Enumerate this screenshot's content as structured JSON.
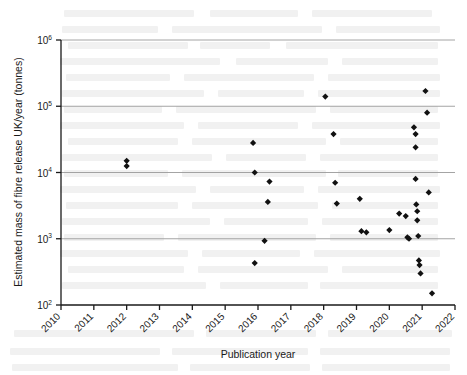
{
  "chart_data": {
    "type": "scatter",
    "title": "",
    "xlabel": "Publication year",
    "ylabel": "Estimated mass of fibre release UK/year (tonnes)",
    "xlim": [
      2010,
      2022
    ],
    "ylim": [
      100,
      1000000
    ],
    "yscale": "log",
    "xscale": "linear",
    "grid": "horizontal-major",
    "legend": "none",
    "marker": "filled-diamond",
    "marker_color": "#111111",
    "xticks": [
      "2010",
      "2011",
      "2012",
      "2013",
      "2014",
      "2015",
      "2016",
      "2017",
      "2018",
      "2019",
      "2020",
      "2021",
      "2022"
    ],
    "xtick_values": [
      2010,
      2011,
      2012,
      2013,
      2014,
      2015,
      2016,
      2017,
      2018,
      2019,
      2020,
      2021,
      2022
    ],
    "xtick_rotation": -45,
    "yticks": [
      "10^2",
      "10^3",
      "10^4",
      "10^5",
      "10^6"
    ],
    "ytick_values": [
      100,
      1000,
      10000,
      100000,
      1000000
    ],
    "ytick_mantissa": "10",
    "ytick_exponents": [
      "2",
      "3",
      "4",
      "5",
      "6"
    ],
    "points": [
      {
        "x": 2012.0,
        "y": 15000
      },
      {
        "x": 2012.0,
        "y": 12500
      },
      {
        "x": 2015.85,
        "y": 28000
      },
      {
        "x": 2015.9,
        "y": 10000
      },
      {
        "x": 2015.9,
        "y": 430
      },
      {
        "x": 2016.35,
        "y": 7300
      },
      {
        "x": 2016.3,
        "y": 3600
      },
      {
        "x": 2016.2,
        "y": 930
      },
      {
        "x": 2018.05,
        "y": 140000
      },
      {
        "x": 2018.3,
        "y": 38000
      },
      {
        "x": 2018.35,
        "y": 7000
      },
      {
        "x": 2018.4,
        "y": 3400
      },
      {
        "x": 2019.1,
        "y": 4000
      },
      {
        "x": 2019.15,
        "y": 1300
      },
      {
        "x": 2019.3,
        "y": 1250
      },
      {
        "x": 2020.0,
        "y": 1350
      },
      {
        "x": 2020.3,
        "y": 2400
      },
      {
        "x": 2020.5,
        "y": 2200
      },
      {
        "x": 2020.55,
        "y": 1050
      },
      {
        "x": 2020.6,
        "y": 1000
      },
      {
        "x": 2020.75,
        "y": 48000
      },
      {
        "x": 2020.8,
        "y": 38000
      },
      {
        "x": 2020.8,
        "y": 24000
      },
      {
        "x": 2020.8,
        "y": 8000
      },
      {
        "x": 2020.82,
        "y": 3300
      },
      {
        "x": 2020.85,
        "y": 2600
      },
      {
        "x": 2020.85,
        "y": 1900
      },
      {
        "x": 2020.88,
        "y": 1100
      },
      {
        "x": 2020.9,
        "y": 470
      },
      {
        "x": 2020.92,
        "y": 400
      },
      {
        "x": 2020.95,
        "y": 300
      },
      {
        "x": 2021.1,
        "y": 170000
      },
      {
        "x": 2021.15,
        "y": 80000
      },
      {
        "x": 2021.2,
        "y": 5000
      },
      {
        "x": 2021.3,
        "y": 150
      }
    ]
  },
  "background": {
    "description": "faint-scanned-page-text-bleedthrough"
  }
}
